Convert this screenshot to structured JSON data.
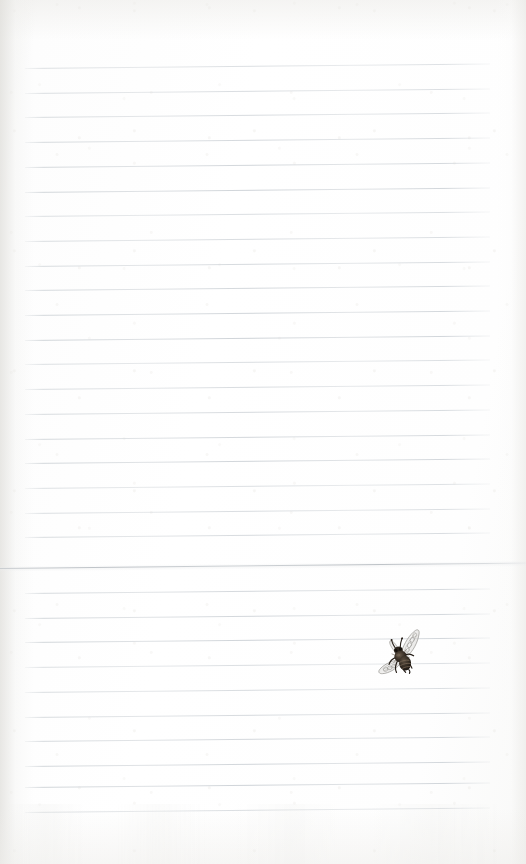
{
  "page": {
    "kind": "lined-notebook-paper",
    "width": 526,
    "height": 864,
    "background_color": "#fefefe",
    "paper_tint": "#f9f9f8",
    "caption": ""
  },
  "rules": {
    "label": "ruled-lines",
    "color": "#ced3d7",
    "count": 30,
    "first_line_y": 68,
    "spacing": 24.7,
    "x_start": 25,
    "x_end": 490,
    "tilt_degrees": -0.55,
    "y_positions": [
      68,
      92.7,
      117.4,
      142.1,
      166.8,
      191.5,
      216.2,
      240.9,
      265.6,
      290.3,
      315.0,
      339.7,
      364.4,
      389.1,
      413.8,
      438.5,
      463.2,
      487.9,
      512.6,
      537.3,
      593.0,
      617.7,
      642.4,
      667.1,
      691.8,
      716.5,
      741.2,
      765.9,
      786.5,
      812.0
    ]
  },
  "seam": {
    "label": "page-seam-line",
    "color": "#bcc1c6",
    "y": 568,
    "x_start": 0,
    "x_end": 526,
    "tilt_degrees": -0.6
  },
  "bee": {
    "label": "bee-illustration",
    "style": "vintage engraving",
    "x": 373,
    "y": 629,
    "width": 54,
    "height": 54,
    "body_color": "#3a3129",
    "body_dark": "#241d17",
    "wing_color": "#b9b6b2",
    "wing_fill": "#e8e7e5",
    "accent_color": "#6d6055",
    "rotation_degrees": -18
  },
  "icons": {
    "bee": "bee-icon"
  }
}
